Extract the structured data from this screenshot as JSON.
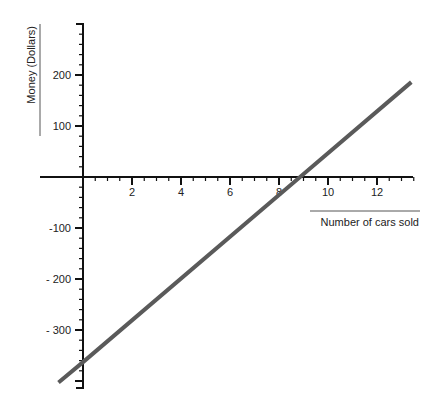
{
  "chart_data": {
    "type": "line",
    "title": "",
    "xlabel": "Number of cars sold",
    "ylabel": "Money (Dollars)",
    "xlim": [
      -1.7,
      13.5
    ],
    "ylim": [
      -410,
      300
    ],
    "x_ticks": [
      2,
      4,
      6,
      8,
      10,
      12
    ],
    "y_ticks": [
      200,
      100,
      -100,
      -200,
      -300
    ],
    "y_tick_labels": [
      "200",
      "100",
      "-100",
      "- 200",
      "- 300"
    ],
    "grid": false,
    "legend": null,
    "series": [
      {
        "name": "Profit",
        "x": [
          -1.0,
          0,
          8.86,
          13.4
        ],
        "y": [
          -403,
          -363,
          0,
          186
        ],
        "color": "#5a5a5a"
      }
    ]
  },
  "colors": {
    "axis": "#111111",
    "line": "#5a5a5a",
    "background": "#ffffff"
  }
}
